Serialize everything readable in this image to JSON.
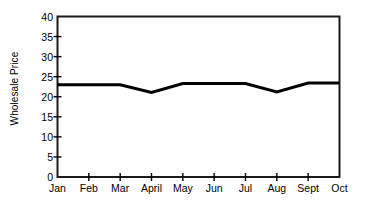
{
  "chart_data": {
    "type": "line",
    "title": "",
    "subtitle": "",
    "xlabel": "",
    "ylabel": "Wholesale Price",
    "categories": [
      "Jan",
      "Feb",
      "Mar",
      "April",
      "May",
      "Jun",
      "Jul",
      "Aug",
      "Sept",
      "Oct"
    ],
    "series": [
      {
        "name": "Wholesale Price",
        "values": [
          23.0,
          23.0,
          23.0,
          21.1,
          23.3,
          23.3,
          23.3,
          21.2,
          23.4,
          23.4
        ],
        "color": "#000000"
      }
    ],
    "ylim": [
      0,
      40
    ],
    "yticks": [
      0,
      5,
      10,
      15,
      20,
      25,
      30,
      35,
      40
    ],
    "ytick_labels": [
      "0",
      "5",
      "10",
      "15",
      "20",
      "25",
      "30",
      "35",
      "40"
    ],
    "xtick_labels": [
      "Jan",
      "Feb",
      "Mar",
      "April",
      "May",
      "Jun",
      "Jul",
      "Aug",
      "Sept",
      "Oct"
    ],
    "grid": false,
    "legend": "none",
    "frame": "box",
    "line_width": 3,
    "background_color": "#ffffff",
    "axis_color": "#000000"
  }
}
